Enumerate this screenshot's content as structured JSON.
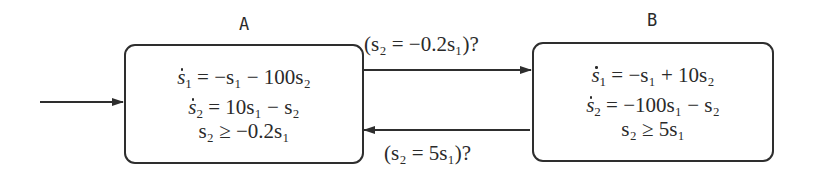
{
  "diagram": {
    "type": "hybrid-automaton",
    "states": [
      {
        "id": "A",
        "label": "A",
        "initial": true,
        "flow": [
          {
            "lhs_var": "s",
            "lhs_sub": "1",
            "rhs": "= −s₁ − 100s₂",
            "text": "ṡ₁ = −s₁ − 100s₂"
          },
          {
            "lhs_var": "s",
            "lhs_sub": "2",
            "rhs": "= 10s₁ − s₂",
            "text": "ṡ₂ = 10s₁ − s₂"
          }
        ],
        "invariant": "s₂ ≥ −0.2s₁"
      },
      {
        "id": "B",
        "label": "B",
        "initial": false,
        "flow": [
          {
            "lhs_var": "s",
            "lhs_sub": "1",
            "rhs": "= −s₁ + 10s₂",
            "text": "ṡ₁ = −s₁ + 10s₂"
          },
          {
            "lhs_var": "s",
            "lhs_sub": "2",
            "rhs": "= −100s₁ − s₂",
            "text": "ṡ₂ = −100s₁ − s₂"
          }
        ],
        "invariant": "s₂ ≥ 5s₁"
      }
    ],
    "transitions": [
      {
        "from": "A",
        "to": "B",
        "guard": "(s₂ = −0.2s₁)?"
      },
      {
        "from": "B",
        "to": "A",
        "guard": "(s₂ = 5s₁)?"
      }
    ],
    "colors": {
      "stroke": "#2e2e2e",
      "text": "#2a2a2a",
      "background": "#ffffff"
    }
  }
}
